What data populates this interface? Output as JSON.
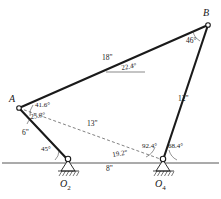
{
  "figure": {
    "type": "four-bar-linkage-kinematic-diagram",
    "points": {
      "A": {
        "label": "A",
        "x": 19,
        "y": 108
      },
      "B": {
        "label": "B",
        "x": 208,
        "y": 25
      },
      "O2": {
        "label": "O",
        "sub": "2",
        "x": 68,
        "y": 160
      },
      "O4": {
        "label": "O",
        "sub": "4",
        "x": 163,
        "y": 160
      }
    },
    "links": [
      {
        "name": "crank-O2-A",
        "length_label": "6\"",
        "from": "O2",
        "to": "A"
      },
      {
        "name": "coupler-A-B",
        "length_label": "18\"",
        "from": "A",
        "to": "B"
      },
      {
        "name": "rocker-O4-B",
        "length_label": "12\"",
        "from": "O4",
        "to": "B"
      },
      {
        "name": "ground-O2-O4",
        "length_label": "8\"",
        "from": "O2",
        "to": "O4"
      },
      {
        "name": "diagonal-A-O4",
        "length_label": "13\"",
        "from": "A",
        "to": "O4"
      }
    ],
    "dimensions": {
      "crank": "6\"",
      "coupler": "18\"",
      "rocker": "12\"",
      "ground": "8\"",
      "diagonal": "13\""
    },
    "angles": {
      "at_O2_crank_ground": "45°",
      "at_A_coupler_diagonal": "41.6°",
      "at_A_diagonal_crank": "25.8°",
      "coupler_to_horizontal": "22.4°",
      "at_B_coupler_rocker": "46°",
      "diagonal_to_ground": "19.2°",
      "at_O4_diagonal_rocker": "92.4°",
      "at_O4_rocker_ground": "68.4°"
    },
    "ground_line": {
      "y": 163,
      "x_start": 2,
      "x_end": 219
    },
    "colors": {
      "link": "#1a1a1a",
      "diagonal": "#4a4a4a",
      "ground": "#2b2b2b",
      "background": "#ffffff",
      "text": "#171717"
    }
  }
}
